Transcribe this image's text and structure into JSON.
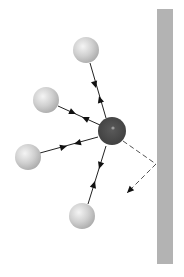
{
  "diagram": {
    "title": "Molecule collision with wall (gas pressure)",
    "canvas": {
      "width": 184,
      "height": 277,
      "background": "#ffffff"
    },
    "wall": {
      "x": 157,
      "y": 9,
      "width": 16,
      "height": 255,
      "color": "#b3b3b3"
    },
    "central_particle": {
      "cx": 112,
      "cy": 131,
      "r": 14,
      "color": "#4a4a4a",
      "highlight": {
        "cx": 113,
        "cy": 128,
        "r": 1.6,
        "color": "#9a9a9a"
      }
    },
    "particles": [
      {
        "id": "top",
        "cx": 86,
        "cy": 50,
        "r": 13,
        "color": "#cfcfcf"
      },
      {
        "id": "upper-left",
        "cx": 46,
        "cy": 100,
        "r": 13,
        "color": "#cfcfcf"
      },
      {
        "id": "left",
        "cx": 28,
        "cy": 157,
        "r": 13,
        "color": "#cfcfcf"
      },
      {
        "id": "bottom",
        "cx": 82,
        "cy": 216,
        "r": 13,
        "color": "#cfcfcf"
      }
    ],
    "interaction_lines": [
      {
        "from": "top",
        "x1": 90,
        "y1": 63,
        "x2": 106,
        "y2": 118,
        "arrow_toward_center": {
          "x": 96,
          "y": 88
        },
        "arrow_toward_particle": {
          "x": 99,
          "y": 96
        }
      },
      {
        "from": "upper-left",
        "x1": 58,
        "y1": 106,
        "x2": 100,
        "y2": 125,
        "arrow_toward_center": {
          "x": 76,
          "y": 114
        },
        "arrow_toward_particle": {
          "x": 82,
          "y": 117
        }
      },
      {
        "from": "left",
        "x1": 40,
        "y1": 153,
        "x2": 98,
        "y2": 137,
        "arrow_toward_center": {
          "x": 67,
          "y": 146
        },
        "arrow_toward_particle": {
          "x": 74,
          "y": 144
        }
      },
      {
        "from": "bottom",
        "x1": 88,
        "y1": 204,
        "x2": 106,
        "y2": 146,
        "arrow_toward_center": {
          "x": 95,
          "y": 181
        },
        "arrow_toward_particle": {
          "x": 99,
          "y": 169
        }
      }
    ],
    "reflection_path": {
      "style": "dashed",
      "color": "#555555",
      "incoming": {
        "x1": 123,
        "y1": 141,
        "x2": 156,
        "y2": 164
      },
      "outgoing": {
        "x1": 156,
        "y1": 164,
        "x2": 127,
        "y2": 193
      }
    },
    "line_color": "#222222",
    "arrow_color": "#111111"
  }
}
